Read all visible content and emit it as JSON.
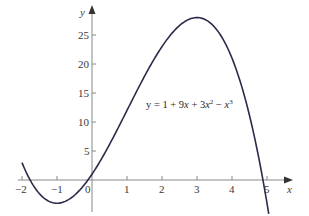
{
  "chart_data": {
    "type": "line",
    "title": "",
    "xlabel": "x",
    "ylabel": "y",
    "xlim": [
      -2,
      5.05
    ],
    "ylim": [
      -5.5,
      28
    ],
    "x_ticks": [
      -2,
      -1,
      0,
      1,
      2,
      3,
      4,
      5
    ],
    "x_tick_labels": [
      "−2",
      "−1",
      "0",
      "1",
      "2",
      "3",
      "4",
      "5"
    ],
    "y_ticks": [
      5,
      10,
      15,
      20,
      25
    ],
    "y_tick_labels": [
      "5",
      "10",
      "15",
      "20",
      "25"
    ],
    "grid": false,
    "legend": null,
    "series": [
      {
        "name": "y = 1 + 9x + 3x² − x³",
        "formula_coeffs": {
          "c0": 1,
          "c1": 9,
          "c2": 3,
          "c3": -1
        },
        "x": [
          -2,
          -1.5,
          -1,
          -0.5,
          0,
          0.5,
          1,
          1.5,
          2,
          2.5,
          3,
          3.5,
          4,
          4.5,
          5
        ],
        "values": [
          3,
          -1.625,
          -4,
          -2.625,
          1,
          6.125,
          12,
          17.875,
          23,
          26.625,
          28,
          26.375,
          21,
          11.125,
          -4
        ]
      }
    ],
    "annotations": [
      {
        "text_parts": [
          "y = 1 + 9",
          "x",
          " + 3",
          "x",
          "2",
          " − ",
          "x",
          "3"
        ],
        "x": 1.0,
        "y": 12
      }
    ],
    "color": "#2b2b4a"
  },
  "labels": {
    "x_axis": "x",
    "y_axis": "y",
    "formula_prefix": "y = 1 + 9",
    "formula_x1": "x",
    "formula_mid": " + 3",
    "formula_x2": "x",
    "formula_exp2": "2",
    "formula_minus": " − ",
    "formula_x3": "x",
    "formula_exp3": "3",
    "xt": [
      "−2",
      "−1",
      "0",
      "1",
      "2",
      "3",
      "4",
      "5"
    ],
    "yt": [
      "5",
      "10",
      "15",
      "20",
      "25"
    ]
  }
}
